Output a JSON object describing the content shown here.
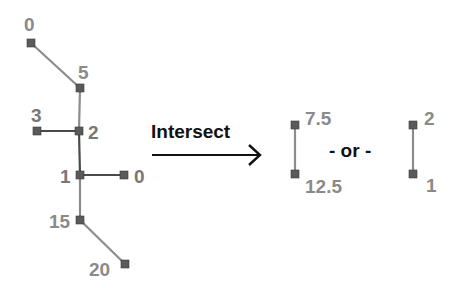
{
  "diagram": {
    "operation_label": "Intersect",
    "separator_label": "- or -",
    "colors": {
      "label": "#8a8a8a",
      "edge": "#8c8c8c",
      "edge_highlight": "#4a4a4a",
      "node": "#5a5a5a",
      "text": "#111111"
    },
    "tree": {
      "nodes": [
        {
          "id": "n0_top",
          "label": "0",
          "x": 31,
          "y": 43
        },
        {
          "id": "n5",
          "label": "5",
          "x": 80,
          "y": 88
        },
        {
          "id": "n3",
          "label": "3",
          "x": 37,
          "y": 131
        },
        {
          "id": "n2",
          "label": "2",
          "x": 79,
          "y": 131
        },
        {
          "id": "n1",
          "label": "1",
          "x": 80,
          "y": 175
        },
        {
          "id": "n0_right",
          "label": "0",
          "x": 124,
          "y": 175
        },
        {
          "id": "n15",
          "label": "15",
          "x": 80,
          "y": 220
        },
        {
          "id": "n20",
          "label": "20",
          "x": 125,
          "y": 264
        }
      ]
    },
    "result_a": {
      "top_label": "7.5",
      "bottom_label": "12.5"
    },
    "result_b": {
      "top_label": "2",
      "bottom_label": "1"
    }
  }
}
